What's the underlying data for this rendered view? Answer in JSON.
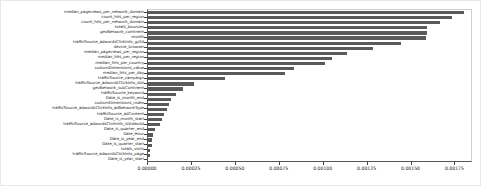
{
  "chart_data": {
    "type": "bar",
    "orientation": "horizontal",
    "title": "",
    "xlabel": "",
    "ylabel": "",
    "grid": false,
    "legend": null,
    "xlim": [
      0.0,
      0.00185
    ],
    "xticks": [
      0.0,
      0.00025,
      0.0005,
      0.00075,
      0.001,
      0.00125,
      0.0015,
      0.00175
    ],
    "xticklabels": [
      "0.00000",
      "0.00025",
      "0.00050",
      "0.00075",
      "0.00100",
      "0.00125",
      "0.00150",
      "0.00175"
    ],
    "bar_color": "#5a5a5a",
    "categories": [
      "median_pageviews_per_network_domain",
      "count_hits_per_region",
      "count_hits_per_network_domain",
      "totals_bounces",
      "geoNetwork_continent",
      "month",
      "trafficSource_adwordsClickInfo_gclId",
      "device_browser",
      "median_pageviews_per_region",
      "median_hits_per_region",
      "median_hits_per_country",
      "customDimensions_value",
      "median_hits_per_day",
      "trafficSource_campaign",
      "trafficSource_adwordsClickInfo_slot",
      "geoNetwork_subContinent",
      "trafficSource_keyword",
      "Date_is_month_end",
      "customDimensions_index",
      "trafficSource_adwordsClickInfo_adNetworkType",
      "trafficSource_adContent",
      "Date_is_month_start",
      "trafficSource_adwordsClickInfo_isVideoAd",
      "Date_is_quarter_end",
      "Date_Hour",
      "Date_is_year_end",
      "Date_is_quarter_start",
      "totals_visits",
      "trafficSource_adwordsClickInfo_page",
      "Date_is_year_start"
    ],
    "values": [
      0.0018,
      0.00173,
      0.00166,
      0.00159,
      0.00159,
      0.00158,
      0.00144,
      0.00128,
      0.00113,
      0.00105,
      0.00101,
      0.00083,
      0.00078,
      0.00044,
      0.00026,
      0.0002,
      0.00016,
      0.00013,
      0.00012,
      0.00011,
      9e-05,
      8e-05,
      7e-05,
      4e-05,
      3e-05,
      2e-05,
      2e-05,
      1e-05,
      1e-05,
      0.0
    ]
  }
}
